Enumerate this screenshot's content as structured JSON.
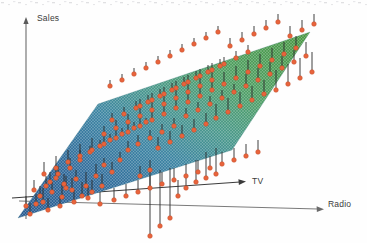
{
  "figure": {
    "title": "",
    "background": "#fefefe"
  },
  "axes": {
    "vertical": {
      "label": "Sales",
      "color": "#5a5a5a"
    },
    "depth": {
      "label": "TV",
      "color": "#3a3a3a"
    },
    "horizontal": {
      "label": "Radio",
      "color": "#6a6a6a"
    }
  },
  "chart_data": {
    "type": "scatter",
    "title": "",
    "subtitle": "",
    "xlabel": "TV",
    "ylabel": "Radio",
    "zlabel": "Sales",
    "grid": false,
    "legend": null,
    "annotations": [],
    "surface": {
      "description": "least-squares regression plane of Sales on TV and Radio",
      "mesh": true,
      "colormap": [
        "#2f6296",
        "#3f7fa8",
        "#4f9c9a",
        "#54a45e",
        "#4e9a45"
      ],
      "gradient_low_color": "#2f6296",
      "gradient_high_color": "#4e9a45",
      "corners": [
        [
          18,
          218
        ],
        [
          98,
          104
        ],
        [
          310,
          32
        ],
        [
          232,
          150
        ]
      ]
    },
    "points": {
      "marker": "circle",
      "marker_color": "#e8643c",
      "marker_edge_color": "#c24a26",
      "marker_size": 4.6,
      "stem_color": "#2a2a2a",
      "stem_width": 0.9,
      "count": 200,
      "note": "orange points are observed Sales; stems are residuals to the fitted plane"
    },
    "series": [
      {
        "name": "observations",
        "points": [
          [
            43,
            202,
            188
          ],
          [
            30,
            214,
            203
          ],
          [
            62,
            197,
            184
          ],
          [
            66,
            188,
            176
          ],
          [
            76,
            179,
            170
          ],
          [
            86,
            186,
            172
          ],
          [
            96,
            176,
            164
          ],
          [
            104,
            165,
            158
          ],
          [
            112,
            172,
            162
          ],
          [
            120,
            160,
            152
          ],
          [
            50,
            182,
            172
          ],
          [
            58,
            174,
            166
          ],
          [
            70,
            168,
            158
          ],
          [
            80,
            160,
            150
          ],
          [
            90,
            152,
            146
          ],
          [
            100,
            146,
            140
          ],
          [
            110,
            140,
            134
          ],
          [
            122,
            134,
            128
          ],
          [
            134,
            128,
            122
          ],
          [
            146,
            122,
            118
          ],
          [
            128,
            150,
            141
          ],
          [
            138,
            144,
            135
          ],
          [
            150,
            138,
            130
          ],
          [
            162,
            132,
            124
          ],
          [
            174,
            126,
            118
          ],
          [
            158,
            148,
            137
          ],
          [
            170,
            142,
            131
          ],
          [
            182,
            136,
            125
          ],
          [
            194,
            130,
            119
          ],
          [
            206,
            124,
            113
          ],
          [
            186,
            116,
            108
          ],
          [
            198,
            110,
            102
          ],
          [
            210,
            104,
            96
          ],
          [
            222,
            98,
            90
          ],
          [
            234,
            92,
            84
          ],
          [
            216,
            118,
            104
          ],
          [
            228,
            112,
            98
          ],
          [
            240,
            106,
            92
          ],
          [
            252,
            100,
            86
          ],
          [
            264,
            94,
            80
          ],
          [
            246,
            86,
            74
          ],
          [
            258,
            80,
            68
          ],
          [
            270,
            74,
            62
          ],
          [
            282,
            68,
            56
          ],
          [
            294,
            62,
            50
          ],
          [
            276,
            90,
            70
          ],
          [
            288,
            84,
            64
          ],
          [
            300,
            78,
            58
          ],
          [
            312,
            72,
            52
          ],
          [
            306,
            56,
            42
          ],
          [
            140,
            106,
            99
          ],
          [
            152,
            100,
            93
          ],
          [
            164,
            94,
            87
          ],
          [
            176,
            88,
            81
          ],
          [
            188,
            82,
            75
          ],
          [
            200,
            76,
            69
          ],
          [
            212,
            70,
            63
          ],
          [
            224,
            64,
            57
          ],
          [
            236,
            58,
            51
          ],
          [
            248,
            52,
            45
          ],
          [
            112,
            120,
            113
          ],
          [
            124,
            114,
            107
          ],
          [
            136,
            108,
            101
          ],
          [
            148,
            102,
            95
          ],
          [
            160,
            96,
            89
          ],
          [
            172,
            90,
            83
          ],
          [
            184,
            84,
            77
          ],
          [
            196,
            78,
            71
          ],
          [
            208,
            72,
            65
          ],
          [
            220,
            66,
            59
          ],
          [
            104,
            134,
            126
          ],
          [
            116,
            128,
            120
          ],
          [
            128,
            122,
            114
          ],
          [
            140,
            116,
            108
          ],
          [
            152,
            110,
            102
          ],
          [
            164,
            104,
            96
          ],
          [
            176,
            98,
            90
          ],
          [
            188,
            92,
            84
          ],
          [
            200,
            86,
            78
          ],
          [
            212,
            80,
            72
          ],
          [
            34,
            190,
            180
          ],
          [
            40,
            196,
            186
          ],
          [
            46,
            186,
            176
          ],
          [
            52,
            192,
            182
          ],
          [
            56,
            178,
            168
          ],
          [
            64,
            184,
            174
          ],
          [
            72,
            190,
            178
          ],
          [
            82,
            196,
            182
          ],
          [
            92,
            192,
            180
          ],
          [
            102,
            186,
            174
          ],
          [
            26,
            206,
            196
          ],
          [
            36,
            204,
            194
          ],
          [
            48,
            210,
            198
          ],
          [
            60,
            206,
            196
          ],
          [
            74,
            202,
            190
          ],
          [
            88,
            198,
            186
          ],
          [
            100,
            204,
            192
          ],
          [
            114,
            200,
            188
          ],
          [
            126,
            196,
            184
          ],
          [
            138,
            192,
            180
          ],
          [
            150,
            188,
            176
          ],
          [
            162,
            184,
            172
          ],
          [
            174,
            180,
            168
          ],
          [
            186,
            176,
            164
          ],
          [
            198,
            172,
            160
          ],
          [
            210,
            168,
            156
          ],
          [
            222,
            164,
            152
          ],
          [
            234,
            160,
            148
          ],
          [
            246,
            156,
            144
          ],
          [
            258,
            152,
            140
          ],
          [
            110,
            86,
            80
          ],
          [
            122,
            80,
            74
          ],
          [
            134,
            74,
            68
          ],
          [
            146,
            68,
            62
          ],
          [
            158,
            62,
            56
          ],
          [
            170,
            56,
            50
          ],
          [
            182,
            50,
            44
          ],
          [
            194,
            44,
            38
          ],
          [
            206,
            38,
            32
          ],
          [
            218,
            32,
            26
          ],
          [
            230,
            46,
            38
          ],
          [
            242,
            40,
            32
          ],
          [
            254,
            34,
            26
          ],
          [
            266,
            28,
            20
          ],
          [
            278,
            22,
            14
          ],
          [
            290,
            36,
            26
          ],
          [
            302,
            30,
            20
          ],
          [
            314,
            24,
            14
          ],
          [
            296,
            48,
            36
          ],
          [
            284,
            54,
            42
          ],
          [
            272,
            60,
            48
          ],
          [
            260,
            66,
            54
          ],
          [
            248,
            72,
            60
          ],
          [
            236,
            78,
            66
          ],
          [
            224,
            84,
            72
          ],
          [
            212,
            90,
            78
          ],
          [
            200,
            96,
            84
          ],
          [
            188,
            102,
            90
          ],
          [
            176,
            108,
            96
          ],
          [
            164,
            114,
            102
          ],
          [
            152,
            120,
            108
          ],
          [
            140,
            126,
            114
          ],
          [
            128,
            132,
            120
          ],
          [
            116,
            138,
            126
          ],
          [
            104,
            144,
            132
          ],
          [
            92,
            150,
            138
          ],
          [
            80,
            156,
            144
          ],
          [
            68,
            162,
            150
          ],
          [
            56,
            168,
            156
          ],
          [
            44,
            174,
            162
          ],
          [
            170,
            218,
            168
          ],
          [
            178,
            196,
            180
          ],
          [
            160,
            226,
            170
          ],
          [
            150,
            236,
            172
          ],
          [
            186,
            188,
            178
          ],
          [
            196,
            182,
            160
          ],
          [
            206,
            178,
            152
          ],
          [
            216,
            174,
            148
          ],
          [
            150,
            170,
            160
          ],
          [
            140,
            176,
            166
          ]
        ],
        "schema": [
          "x_px",
          "y_px_point",
          "y_px_surface_anchor"
        ]
      }
    ]
  }
}
